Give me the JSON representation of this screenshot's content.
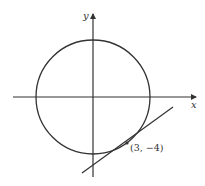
{
  "diagram": {
    "title": "",
    "axes": {
      "x_label": "x",
      "y_label": "y"
    },
    "circle": {
      "center": [
        0,
        0
      ],
      "radius": 5,
      "equation": "x^2 + y^2 = 25"
    },
    "tangent_line": {
      "point": [
        3,
        -4
      ],
      "slope": 0.75
    },
    "point_label": "(3, −4)",
    "colors": {
      "stroke": "#333333",
      "background": "#ffffff"
    }
  }
}
